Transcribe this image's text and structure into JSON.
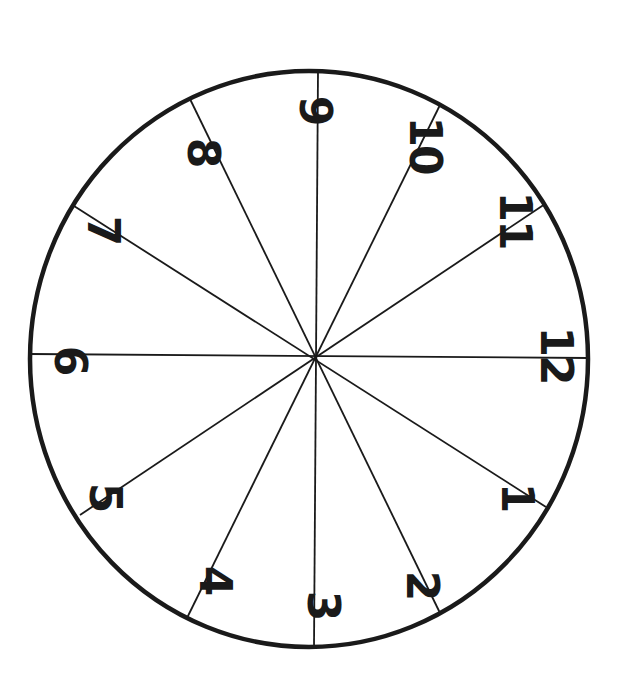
{
  "diagram": {
    "type": "clock-face-dial",
    "orientation_rotation_deg": 90,
    "stroke_color": "#1a1a1a",
    "background_color": "#ffffff",
    "circle": {
      "cx": 309,
      "cy": 359,
      "rx": 279,
      "ry": 288
    },
    "center": {
      "x": 316,
      "y": 356
    },
    "spokes": [
      {
        "id": "spoke-12-6",
        "x1": 30,
        "y1": 354,
        "x2": 588,
        "y2": 358
      },
      {
        "id": "spoke-9-3",
        "x1": 318,
        "y1": 71,
        "x2": 314,
        "y2": 647
      },
      {
        "id": "spoke-8-2",
        "x1": 190,
        "y1": 99,
        "x2": 440,
        "y2": 613
      },
      {
        "id": "spoke-10-4",
        "x1": 440,
        "y1": 105,
        "x2": 187,
        "y2": 618
      },
      {
        "id": "spoke-7-1",
        "x1": 74,
        "y1": 206,
        "x2": 546,
        "y2": 507
      },
      {
        "id": "spoke-11-5",
        "x1": 545,
        "y1": 204,
        "x2": 80,
        "y2": 515
      }
    ],
    "numerals": [
      {
        "label": "1",
        "x": 517,
        "y": 497
      },
      {
        "label": "2",
        "x": 422,
        "y": 585
      },
      {
        "label": "3",
        "x": 323,
        "y": 605
      },
      {
        "label": "4",
        "x": 215,
        "y": 580
      },
      {
        "label": "5",
        "x": 105,
        "y": 497
      },
      {
        "label": "6",
        "x": 70,
        "y": 360
      },
      {
        "label": "7",
        "x": 103,
        "y": 230
      },
      {
        "label": "8",
        "x": 203,
        "y": 152
      },
      {
        "label": "9",
        "x": 315,
        "y": 110
      },
      {
        "label": "10",
        "x": 425,
        "y": 145
      },
      {
        "label": "11",
        "x": 515,
        "y": 220
      },
      {
        "label": "12",
        "x": 556,
        "y": 355
      }
    ]
  }
}
